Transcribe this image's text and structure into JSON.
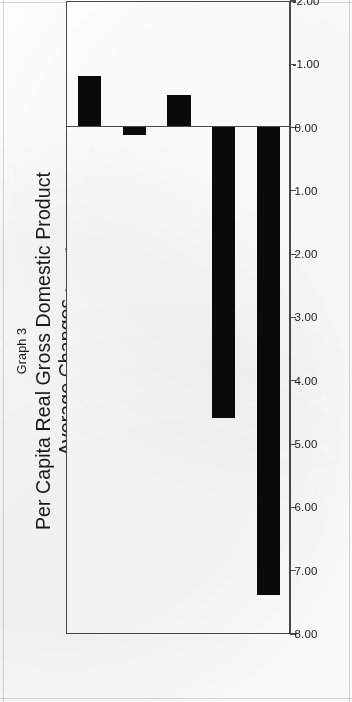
{
  "figure": {
    "number_label": "Graph 3",
    "title_line_1": "Per Capita Real Gross Domestic Product",
    "title_line_2": "Average Changes",
    "title_units": "(percent)"
  },
  "chart_data": {
    "type": "bar",
    "title": "Per Capita Real Gross Domestic Product Average Changes (percent)",
    "subtitle": "Graph 3",
    "orientation": "vertical",
    "categories": [
      "71/75",
      "76/80",
      "81/85",
      "86/90",
      "91"
    ],
    "values": [
      7.4,
      4.6,
      -0.5,
      0.13,
      -0.8
    ],
    "xlabel": "Years",
    "ylabel": "",
    "ylim": [
      -2.0,
      8.0
    ],
    "ytick_labels": [
      "8.00",
      "7.00",
      "6.00",
      "5.00",
      "4.00",
      "3.00",
      "2.00",
      "1.00",
      "0.00",
      "-1.00",
      "-2.00"
    ],
    "ytick_values": [
      8.0,
      7.0,
      6.0,
      5.0,
      4.0,
      3.0,
      2.0,
      1.0,
      0.0,
      -1.0,
      -2.0
    ],
    "grid": false,
    "legend": null,
    "bar_color": "#0a0a0a",
    "frame_color": "#4a4a4a"
  }
}
